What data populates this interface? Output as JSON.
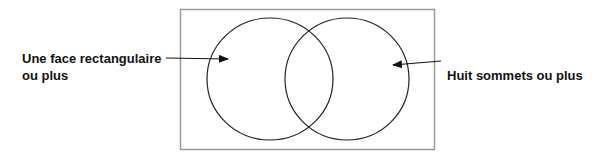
{
  "diagram": {
    "type": "venn",
    "sets": [
      {
        "id": "left",
        "label_line1": "Une face rectangulaire",
        "label_line2": "ou plus"
      },
      {
        "id": "right",
        "label": "Huit sommets ou plus"
      }
    ],
    "colors": {
      "frame": "#9a9a9a",
      "circles": "#222222",
      "text": "#111111"
    }
  }
}
